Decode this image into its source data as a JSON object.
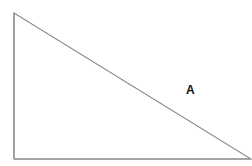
{
  "diagram": {
    "type": "right-triangle",
    "vertices": {
      "top_left": [
        14,
        13
      ],
      "bottom_left": [
        14,
        159
      ],
      "bottom_right": [
        251,
        159
      ]
    },
    "stroke_color": "#8a8a8a",
    "label": {
      "text": "A",
      "position": [
        186,
        84
      ]
    }
  }
}
